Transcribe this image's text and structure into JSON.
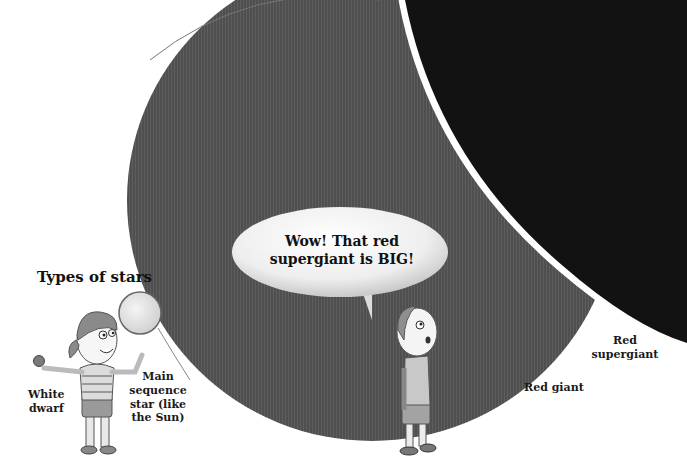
{
  "title": "Types of stars",
  "speech_bubble": {
    "line1": "Wow! That red",
    "line2": "supergiant is BIG!"
  },
  "labels": {
    "white_dwarf": [
      "White",
      "dwarf"
    ],
    "main_sequence": [
      "Main",
      "sequence",
      "star (like",
      "the Sun)"
    ],
    "red_giant": "Red giant",
    "red_supergiant": [
      "Red",
      "supergiant"
    ]
  },
  "colors": {
    "red_giant_fill": "#4e4e4e",
    "red_supergiant_fill": "#111111",
    "background": "#ffffff"
  }
}
